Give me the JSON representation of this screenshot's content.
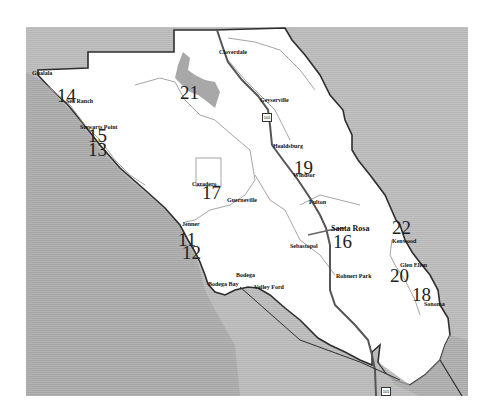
{
  "map": {
    "region": "Sonoma County",
    "colors": {
      "land": "#ffffff",
      "water_ocean": "#a9a9a9",
      "neighbor_land": "#bdbdbd",
      "border": "#2e2e2e",
      "rivers": "#a5a5a5",
      "highway": "#555555"
    },
    "towns": [
      {
        "name": "Gualala",
        "x": 32,
        "y": 70
      },
      {
        "name": "Sea Ranch",
        "x": 66,
        "y": 98
      },
      {
        "name": "Stewarts Point",
        "x": 80,
        "y": 124
      },
      {
        "name": "Cloverdale",
        "x": 219,
        "y": 49
      },
      {
        "name": "Geyserville",
        "x": 260,
        "y": 97
      },
      {
        "name": "Healdsburg",
        "x": 273,
        "y": 143
      },
      {
        "name": "Windsor",
        "x": 293,
        "y": 172
      },
      {
        "name": "Cazadero",
        "x": 192,
        "y": 181
      },
      {
        "name": "Guerneville",
        "x": 227,
        "y": 197
      },
      {
        "name": "Fulton",
        "x": 309,
        "y": 199
      },
      {
        "name": "Jenner",
        "x": 182,
        "y": 221
      },
      {
        "name": "Santa Rosa",
        "x": 331,
        "y": 225,
        "big": true
      },
      {
        "name": "Sebastopol",
        "x": 290,
        "y": 243
      },
      {
        "name": "Kenwood",
        "x": 392,
        "y": 238
      },
      {
        "name": "Glen Ellen",
        "x": 400,
        "y": 262
      },
      {
        "name": "Bodega",
        "x": 236,
        "y": 272
      },
      {
        "name": "Rohnert Park",
        "x": 336,
        "y": 273
      },
      {
        "name": "Bodega Bay",
        "x": 208,
        "y": 281
      },
      {
        "name": "Valley Ford",
        "x": 254,
        "y": 284
      },
      {
        "name": "Sonoma",
        "x": 424,
        "y": 301
      }
    ],
    "region_numbers": [
      {
        "label": "14",
        "x": 57,
        "y": 86
      },
      {
        "label": "21",
        "x": 180,
        "y": 83
      },
      {
        "label": "15",
        "x": 88,
        "y": 126
      },
      {
        "label": "13",
        "x": 88,
        "y": 140
      },
      {
        "label": "19",
        "x": 294,
        "y": 158
      },
      {
        "label": "17",
        "x": 202,
        "y": 183
      },
      {
        "label": "11",
        "x": 178,
        "y": 230
      },
      {
        "label": "12",
        "x": 182,
        "y": 243
      },
      {
        "label": "16",
        "x": 333,
        "y": 232
      },
      {
        "label": "22",
        "x": 392,
        "y": 218
      },
      {
        "label": "20",
        "x": 390,
        "y": 266
      },
      {
        "label": "18",
        "x": 412,
        "y": 285
      }
    ],
    "highway_shields": [
      {
        "label": "101",
        "x": 266,
        "y": 113
      },
      {
        "label": "101",
        "x": 381,
        "y": 387
      }
    ]
  }
}
